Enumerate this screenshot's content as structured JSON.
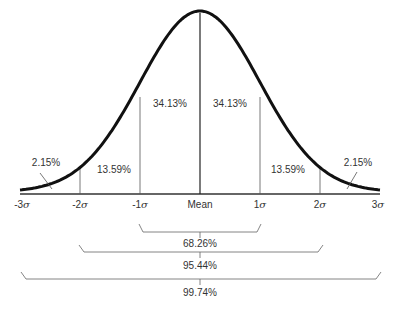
{
  "chart_data": {
    "type": "area",
    "title": "",
    "xlabel": "",
    "ylabel": "",
    "x_ticks": [
      "-3σ",
      "-2σ",
      "-1σ",
      "Mean",
      "1σ",
      "2σ",
      "3σ"
    ],
    "regions": [
      {
        "from": "-3σ",
        "to": "-2σ",
        "percent": "2.15%"
      },
      {
        "from": "-2σ",
        "to": "-1σ",
        "percent": "13.59%"
      },
      {
        "from": "-1σ",
        "to": "Mean",
        "percent": "34.13%"
      },
      {
        "from": "Mean",
        "to": "1σ",
        "percent": "34.13%"
      },
      {
        "from": "1σ",
        "to": "2σ",
        "percent": "13.59%"
      },
      {
        "from": "2σ",
        "to": "3σ",
        "percent": "2.15%"
      }
    ],
    "brackets": [
      {
        "range": "±1σ",
        "percent": "68.26%"
      },
      {
        "range": "±2σ",
        "percent": "95.44%"
      },
      {
        "range": "±3σ",
        "percent": "99.74%"
      }
    ],
    "grid": false,
    "legend": null
  },
  "labels": {
    "r1": "2.15%",
    "r2": "13.59%",
    "r3": "34.13%",
    "r4": "34.13%",
    "r5": "13.59%",
    "r6": "2.15%",
    "b1": "68.26%",
    "b2": "95.44%",
    "b3": "99.74%",
    "t_m3": "-3",
    "t_m2": "-2",
    "t_m1": "-1",
    "t_mean": "Mean",
    "t_p1": "1",
    "t_p2": "2",
    "t_p3": "3",
    "sigma": "σ"
  }
}
